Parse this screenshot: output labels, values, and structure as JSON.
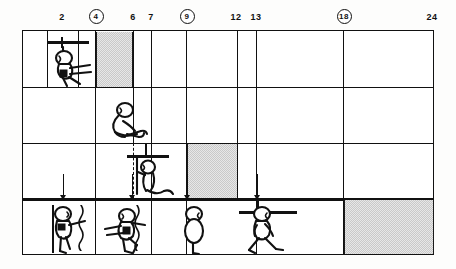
{
  "axis": {
    "unit_note": "",
    "ticks": [
      {
        "value": "2",
        "x": 62,
        "circled": false
      },
      {
        "value": "4",
        "x": 95,
        "circled": true
      },
      {
        "value": "6",
        "x": 133,
        "circled": false
      },
      {
        "value": "7",
        "x": 151,
        "circled": false
      },
      {
        "value": "9",
        "x": 186,
        "circled": true
      },
      {
        "value": "12",
        "x": 236,
        "circled": false
      },
      {
        "value": "13",
        "x": 256,
        "circled": false
      },
      {
        "value": "18",
        "x": 343,
        "circled": true
      },
      {
        "value": "24",
        "x": 432,
        "circled": false
      }
    ]
  },
  "rows": [
    {
      "name": "row-1-prone-head-lift",
      "figures": [
        {
          "name": "figure-prone-push-up",
          "x": 48,
          "y": 10
        }
      ],
      "bars": [
        {
          "name": "support-rail-row1",
          "x": 45,
          "y": 5,
          "w": 42
        }
      ],
      "shades": [
        {
          "name": "shaded-band-4-to-6",
          "from": 95,
          "to": 133
        }
      ]
    },
    {
      "name": "row-2-sits-without-support",
      "figures": [
        {
          "name": "figure-sitting-unsupported",
          "x": 105,
          "y": 14
        }
      ],
      "bars": [],
      "shades": []
    },
    {
      "name": "row-3-pulls-to-stand",
      "figures": [
        {
          "name": "figure-kneeling-pull-up",
          "x": 132,
          "y": 10
        }
      ],
      "bars": [
        {
          "name": "support-rail-row3",
          "x": 128,
          "y": 6,
          "w": 41
        }
      ],
      "shades": [
        {
          "name": "shaded-band-9-to-12",
          "from": 186,
          "to": 238
        }
      ],
      "droplines": [
        {
          "name": "dashed-drop-line-row3",
          "x": 110
        }
      ]
    },
    {
      "name": "row-4-walks-independently",
      "figures": [
        {
          "name": "figure-cruising-along-rail",
          "x": 32,
          "y": 10
        },
        {
          "name": "figure-crawling-creeping",
          "x": 88,
          "y": 12
        },
        {
          "name": "figure-standing-alone",
          "x": 172,
          "y": 10
        },
        {
          "name": "figure-walking",
          "x": 238,
          "y": 10
        }
      ],
      "bars": [
        {
          "name": "vertical-support-rail-row4",
          "x": 34,
          "y": 4,
          "h": 50,
          "vertical": true
        },
        {
          "name": "push-rail-row4",
          "x": 232,
          "y": 4,
          "w": 56
        }
      ],
      "shades": [
        {
          "name": "shaded-band-18-to-24",
          "from": 343,
          "to": 434
        }
      ],
      "droplines": [
        {
          "name": "wavy-drop-line-a",
          "x": 70
        },
        {
          "name": "wavy-drop-line-b",
          "x": 126
        }
      ],
      "arrows": [
        {
          "name": "entry-arrow-2",
          "x": 62
        },
        {
          "name": "entry-arrow-7",
          "x": 131
        },
        {
          "name": "entry-arrow-9",
          "x": 186
        },
        {
          "name": "entry-arrow-13",
          "x": 256
        }
      ]
    }
  ],
  "grid": {
    "left": 22,
    "top": 30,
    "width": 412,
    "height": 225,
    "row_height": 56,
    "column_lines": [
      47,
      78,
      95,
      133,
      151,
      186,
      236,
      256,
      343
    ],
    "frame_color": "#111111",
    "shade_color": "#c9c9c9"
  }
}
